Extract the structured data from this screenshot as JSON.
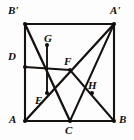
{
  "figure": {
    "type": "geometry-diagram",
    "canvas": {
      "width": 134,
      "height": 140
    },
    "stroke_color": "#15120f",
    "background_color": "#fdfdfd",
    "points": [
      {
        "id": "A",
        "label": "A",
        "x": 25,
        "y": 121,
        "label_x": 9,
        "label_y": 114,
        "dot": true
      },
      {
        "id": "B",
        "label": "B",
        "x": 114,
        "y": 121,
        "label_x": 119,
        "label_y": 114,
        "dot": true
      },
      {
        "id": "Ap",
        "label": "A'",
        "x": 114,
        "y": 24,
        "label_x": 110,
        "label_y": 5,
        "dot": true
      },
      {
        "id": "Bp",
        "label": "B'",
        "x": 25,
        "y": 24,
        "label_x": 8,
        "label_y": 5,
        "dot": true
      },
      {
        "id": "C",
        "label": "C",
        "x": 70,
        "y": 121,
        "label_x": 65,
        "label_y": 125,
        "dot": true
      },
      {
        "id": "D",
        "label": "D",
        "x": 25,
        "y": 67,
        "label_x": 8,
        "label_y": 51,
        "dot": true
      },
      {
        "id": "E",
        "label": "E",
        "x": 47,
        "y": 93,
        "label_x": 35,
        "label_y": 95,
        "dot": true
      },
      {
        "id": "F",
        "label": "F",
        "x": 70,
        "y": 70,
        "label_x": 64,
        "label_y": 56,
        "dot": true
      },
      {
        "id": "G",
        "label": "G",
        "x": 47,
        "y": 45,
        "label_x": 44,
        "label_y": 33,
        "dot": true
      },
      {
        "id": "H",
        "label": "H",
        "x": 92,
        "y": 93,
        "label_x": 88,
        "label_y": 80,
        "dot": true
      }
    ],
    "segments": [
      {
        "name": "side-A-B",
        "from": "A",
        "to": "B",
        "kind": "edge"
      },
      {
        "name": "side-B-Aprime",
        "from": "B",
        "to": "Ap",
        "kind": "edge"
      },
      {
        "name": "side-Aprime-Bprime",
        "from": "Ap",
        "to": "Bp",
        "kind": "edge"
      },
      {
        "name": "side-Bprime-A",
        "from": "Bp",
        "to": "A",
        "kind": "edge"
      },
      {
        "name": "diagonal-Aprime-A",
        "from": "Ap",
        "to": "A",
        "kind": "diag"
      },
      {
        "name": "crease-Bprime-C",
        "from": "Bp",
        "to": "C",
        "kind": "diag"
      },
      {
        "name": "crease-D-F",
        "from": "D",
        "to": "F",
        "kind": "inner"
      },
      {
        "name": "crease-C-Aprime",
        "from": "C",
        "to": "Ap",
        "kind": "inner"
      },
      {
        "name": "crease-F-B",
        "from": "F",
        "to": "B",
        "kind": "inner"
      },
      {
        "name": "segment-G-E",
        "from": "G",
        "to": "E",
        "kind": "vert"
      }
    ]
  }
}
